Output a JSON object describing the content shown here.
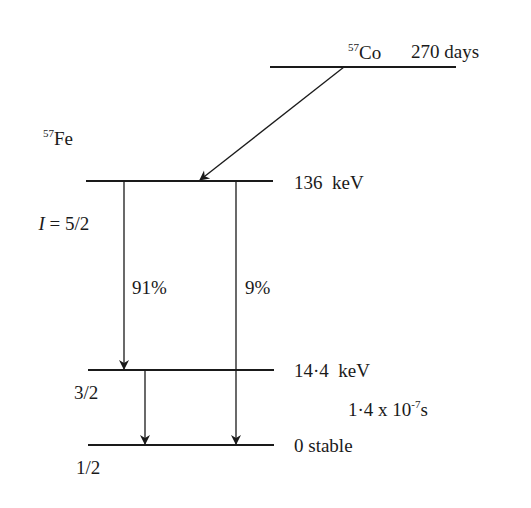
{
  "parent": {
    "mass_number": "57",
    "element": "Co",
    "half_life": "270 days"
  },
  "daughter": {
    "mass_number": "57",
    "element": "Fe"
  },
  "levels": [
    {
      "energy": "136  keV",
      "spin_prefix": "I",
      "spin": " = 5/2"
    },
    {
      "energy": "14·4  keV",
      "spin": "3/2",
      "lifetime_base": "1·4 x 10",
      "lifetime_exp": "-7",
      "lifetime_unit": "s"
    },
    {
      "energy": "0 stable",
      "spin": "1/2"
    }
  ],
  "branches": [
    {
      "label": "91%"
    },
    {
      "label": "9%"
    }
  ],
  "colors": {
    "line": "#1a1a1a",
    "background": "#ffffff"
  }
}
